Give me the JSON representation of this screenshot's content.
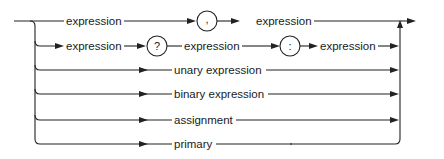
{
  "diagram": {
    "type": "syntax-railroad-diagram",
    "rows": [
      {
        "id": "row1",
        "items": [
          "expression",
          ",",
          "expression"
        ]
      },
      {
        "id": "row2",
        "items": [
          "expression",
          "?",
          "expression",
          ":",
          "expression"
        ]
      },
      {
        "id": "row3",
        "items": [
          "unary expression"
        ]
      },
      {
        "id": "row4",
        "items": [
          "binary expression"
        ]
      },
      {
        "id": "row5",
        "items": [
          "assignment"
        ]
      },
      {
        "id": "row6",
        "items": [
          "primary"
        ]
      }
    ],
    "labels": {
      "r1_expr_a": "expression",
      "r1_comma": ",",
      "r1_expr_b": "expression",
      "r2_expr_a": "expression",
      "r2_q": "?",
      "r2_expr_b": "expression",
      "r2_colon": ":",
      "r2_expr_c": "expression",
      "r3": "unary expression",
      "r4": "binary expression",
      "r5": "assignment",
      "r6": "primary"
    }
  }
}
